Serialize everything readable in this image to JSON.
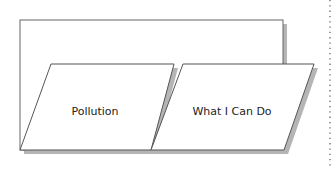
{
  "diagram": {
    "type": "foldable-tab-organizer",
    "back_panel": {
      "label": ""
    },
    "tabs": [
      {
        "label": "Pollution"
      },
      {
        "label": "What I Can Do"
      }
    ]
  },
  "colors": {
    "stroke": "#555555",
    "shadow": "#b0b0b0",
    "fill": "#ffffff",
    "dotted_border": "#666666"
  }
}
